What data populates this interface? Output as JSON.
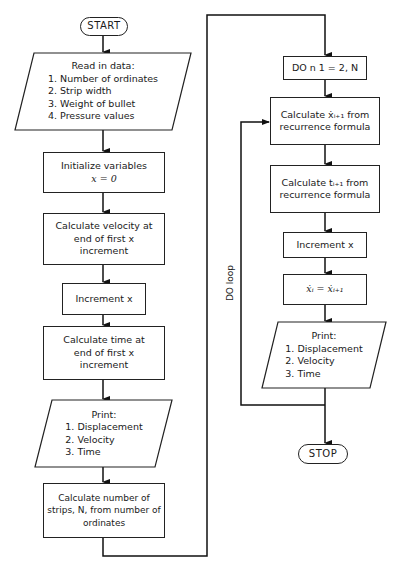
{
  "flowchart": {
    "start": "START",
    "stop": "STOP",
    "read_data": {
      "title": "Read in data:",
      "items": [
        "1.  Number of ordinates",
        "2.  Strip width",
        "3.  Weight of bullet",
        "4.  Pressure values"
      ]
    },
    "initialize": {
      "line1": "Initialize variables",
      "line2": "x = 0"
    },
    "calc_velocity": {
      "line1": "Calculate velocity at",
      "line2": "end of first x",
      "line3": "increment"
    },
    "increment_x_1": "Increment x",
    "calc_time": {
      "line1": "Calculate time at",
      "line2": "end of first x",
      "line3": "increment"
    },
    "print_1": {
      "title": "Print:",
      "items": [
        "1.  Displacement",
        "2.  Velocity",
        "3.  Time"
      ]
    },
    "calc_strips": {
      "line1": "Calculate number of",
      "line2": "strips, N, from number of",
      "line3": "ordinates"
    },
    "do_statement": "DO n 1 = 2, N",
    "calc_xdot": {
      "line1": "Calculate ẋᵢ₊₁ from",
      "line2": "recurrence formula"
    },
    "calc_t": {
      "line1": "Calculate tᵢ₊₁ from",
      "line2": "recurrence formula"
    },
    "increment_x_2": "Increment x",
    "assign_xdot": "ẋᵢ = ẋᵢ₊₁",
    "print_2": {
      "title": "Print:",
      "items": [
        "1.  Displacement",
        "2.  Velocity",
        "3.  Time"
      ]
    },
    "loop_label": "DO loop"
  }
}
